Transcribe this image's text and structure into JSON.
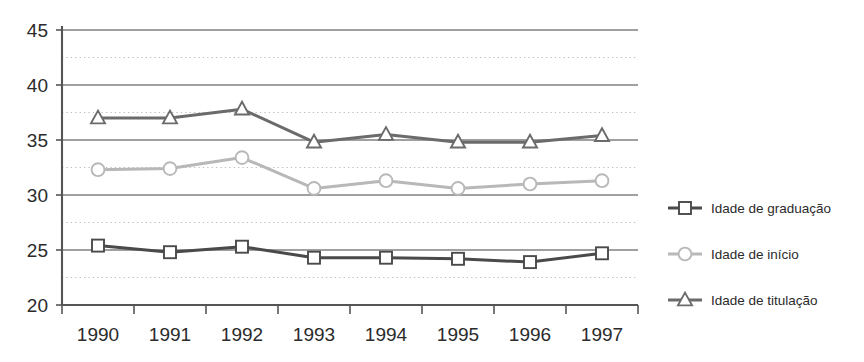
{
  "chart_data": {
    "type": "line",
    "title": "",
    "subtitle": "",
    "xlabel": "",
    "ylabel": "",
    "categories": [
      "1990",
      "1991",
      "1992",
      "1993",
      "1994",
      "1995",
      "1996",
      "1997"
    ],
    "ylim": [
      20,
      45
    ],
    "xlim_categories": true,
    "y_ticks": [
      20,
      25,
      30,
      35,
      40,
      45
    ],
    "y_tick_labels": [
      "20",
      "25",
      "30",
      "35",
      "40",
      "45"
    ],
    "y_minor_gridlines": [
      22.5,
      27.5,
      32.5,
      37.5,
      42.5
    ],
    "grid": "major solid gray, minor dotted light gray, horizontal only",
    "legend_position": "right",
    "series": [
      {
        "name": "Idade de graduação",
        "marker": "open-square",
        "color": "#4a4a4a",
        "values": [
          25.4,
          24.8,
          25.3,
          24.3,
          24.3,
          24.2,
          23.9,
          24.7
        ]
      },
      {
        "name": "Idade  de início",
        "marker": "open-circle",
        "color": "#b8b8b8",
        "values": [
          32.3,
          32.4,
          33.4,
          30.6,
          31.3,
          30.6,
          31.0,
          31.3
        ]
      },
      {
        "name": "Idade  de titulação",
        "marker": "open-triangle",
        "color": "#6b6b6b",
        "values": [
          37.0,
          37.0,
          37.8,
          34.8,
          35.5,
          34.8,
          34.8,
          35.4
        ]
      }
    ]
  },
  "legend": {
    "entries": [
      {
        "label": "Idade de graduação"
      },
      {
        "label": "Idade  de início"
      },
      {
        "label": "Idade  de titulação"
      }
    ]
  },
  "axes": {
    "y_labels": [
      "45",
      "40",
      "35",
      "30",
      "25",
      "20"
    ],
    "x_labels": [
      "1990",
      "1991",
      "1992",
      "1993",
      "1994",
      "1995",
      "1996",
      "1997"
    ]
  },
  "colors": {
    "background": "#ffffff",
    "axis": "#555555",
    "gridline_major": "#808080",
    "gridline_minor": "#bdbdbd",
    "series_graduacao": "#4a4a4a",
    "series_inicio": "#b8b8b8",
    "series_titulacao": "#6b6b6b",
    "text": "#2b2b2b"
  }
}
